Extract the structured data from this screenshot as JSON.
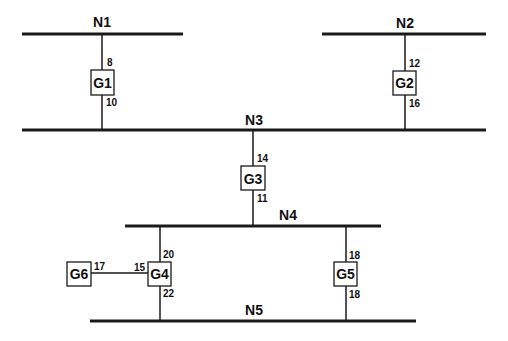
{
  "diagram": {
    "type": "bus network / one-line diagram",
    "buses": [
      {
        "id": "N1",
        "label": "N1"
      },
      {
        "id": "N2",
        "label": "N2"
      },
      {
        "id": "N3",
        "label": "N3"
      },
      {
        "id": "N4",
        "label": "N4"
      },
      {
        "id": "N5",
        "label": "N5"
      }
    ],
    "devices": [
      {
        "id": "G1",
        "label": "G1",
        "connections": [
          {
            "to": "N1",
            "value": "8"
          },
          {
            "to": "N3",
            "value": "10"
          }
        ]
      },
      {
        "id": "G2",
        "label": "G2",
        "connections": [
          {
            "to": "N2",
            "value": "12"
          },
          {
            "to": "N3",
            "value": "16"
          }
        ]
      },
      {
        "id": "G3",
        "label": "G3",
        "connections": [
          {
            "to": "N3",
            "value": "14"
          },
          {
            "to": "N4",
            "value": "11"
          }
        ]
      },
      {
        "id": "G4",
        "label": "G4",
        "connections": [
          {
            "to": "N4",
            "value": "20"
          },
          {
            "to": "N5",
            "value": "22"
          },
          {
            "to": "G6",
            "value": "15"
          }
        ]
      },
      {
        "id": "G5",
        "label": "G5",
        "connections": [
          {
            "to": "N4",
            "value": "18"
          },
          {
            "to": "N5",
            "value": "18"
          }
        ]
      },
      {
        "id": "G6",
        "label": "G6",
        "connections": [
          {
            "to": "G4",
            "value": "17"
          }
        ]
      }
    ]
  },
  "labels": {
    "n1": "N1",
    "n2": "N2",
    "n3": "N3",
    "n4": "N4",
    "n5": "N5",
    "g1": "G1",
    "g2": "G2",
    "g3": "G3",
    "g4": "G4",
    "g5": "G5",
    "g6": "G6",
    "g1_top": "8",
    "g1_bottom": "10",
    "g2_top": "12",
    "g2_bottom": "16",
    "g3_top": "14",
    "g3_bottom": "11",
    "g4_top": "20",
    "g4_bottom": "22",
    "g4_left": "15",
    "g5_top": "18",
    "g5_bottom": "18",
    "g6_right": "17"
  }
}
